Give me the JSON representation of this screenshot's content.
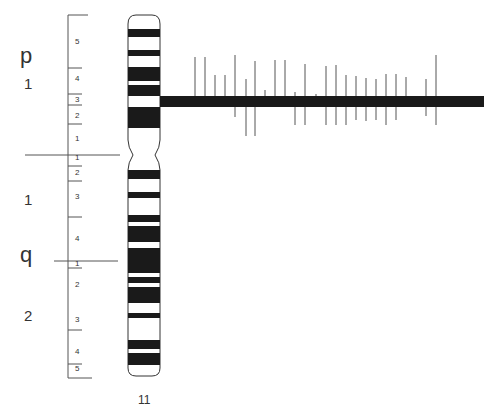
{
  "chromosome": {
    "name": "11",
    "arms": [
      {
        "label": "p",
        "y": 57
      },
      {
        "label": "q",
        "y": 256
      }
    ],
    "regions": [
      {
        "label": "1",
        "x": 24,
        "y": 84
      },
      {
        "label": "1",
        "x": 24,
        "y": 200
      },
      {
        "label": "2",
        "x": 24,
        "y": 316
      }
    ],
    "band_numbers": [
      {
        "label": "5",
        "y": 42
      },
      {
        "label": "4",
        "y": 79
      },
      {
        "label": "3",
        "y": 100
      },
      {
        "label": "2",
        "y": 116
      },
      {
        "label": "1",
        "y": 139
      },
      {
        "label": "1",
        "y": 158
      },
      {
        "label": "2",
        "y": 173
      },
      {
        "label": "3",
        "y": 197
      },
      {
        "label": "4",
        "y": 239
      },
      {
        "label": "1",
        "y": 264
      },
      {
        "label": "2",
        "y": 285
      },
      {
        "label": "3",
        "y": 320
      },
      {
        "label": "4",
        "y": 352
      },
      {
        "label": "5",
        "y": 369
      }
    ],
    "dark_bands": [
      {
        "y1": 29,
        "y2": 37
      },
      {
        "y1": 50,
        "y2": 56
      },
      {
        "y1": 67,
        "y2": 81
      },
      {
        "y1": 85,
        "y2": 96
      },
      {
        "y1": 107,
        "y2": 128
      },
      {
        "y1": 170,
        "y2": 179
      },
      {
        "y1": 192,
        "y2": 198
      },
      {
        "y1": 215,
        "y2": 222
      },
      {
        "y1": 226,
        "y2": 242
      },
      {
        "y1": 248,
        "y2": 273
      },
      {
        "y1": 277,
        "y2": 283
      },
      {
        "y1": 287,
        "y2": 303
      },
      {
        "y1": 313,
        "y2": 318
      },
      {
        "y1": 340,
        "y2": 349
      },
      {
        "y1": 353,
        "y2": 365
      }
    ]
  },
  "gene_bar": {
    "x1": 160,
    "x2": 484,
    "y1": 96,
    "y2": 107,
    "ticks": [
      {
        "x": 195,
        "top": 57,
        "bottom": 96
      },
      {
        "x": 205,
        "top": 57,
        "bottom": 96
      },
      {
        "x": 215,
        "top": 75,
        "bottom": 96
      },
      {
        "x": 225,
        "top": 75,
        "bottom": 96
      },
      {
        "x": 235,
        "top": 55,
        "bottom": 117
      },
      {
        "x": 246,
        "top": 79,
        "bottom": 136
      },
      {
        "x": 255,
        "top": 61,
        "bottom": 136
      },
      {
        "x": 265,
        "top": 90,
        "bottom": 96
      },
      {
        "x": 275,
        "top": 60,
        "bottom": 96
      },
      {
        "x": 285,
        "top": 60,
        "bottom": 96
      },
      {
        "x": 295,
        "top": 92,
        "bottom": 125
      },
      {
        "x": 305,
        "top": 64,
        "bottom": 125
      },
      {
        "x": 316,
        "top": 94,
        "bottom": 96
      },
      {
        "x": 326,
        "top": 66,
        "bottom": 125
      },
      {
        "x": 336,
        "top": 65,
        "bottom": 125
      },
      {
        "x": 346,
        "top": 75,
        "bottom": 125
      },
      {
        "x": 356,
        "top": 76,
        "bottom": 120
      },
      {
        "x": 366,
        "top": 78,
        "bottom": 121
      },
      {
        "x": 376,
        "top": 79,
        "bottom": 120
      },
      {
        "x": 386,
        "top": 74,
        "bottom": 125
      },
      {
        "x": 396,
        "top": 74,
        "bottom": 120
      },
      {
        "x": 406,
        "top": 77,
        "bottom": 96
      },
      {
        "x": 426,
        "top": 79,
        "bottom": 116
      },
      {
        "x": 436,
        "top": 55,
        "bottom": 125
      }
    ]
  },
  "colors": {
    "ink": "#1a1a1a",
    "line": "#555555",
    "background": "#ffffff"
  }
}
